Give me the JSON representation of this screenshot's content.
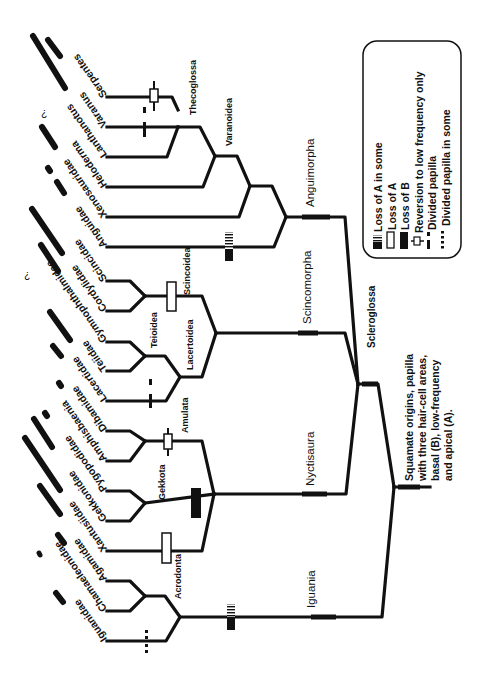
{
  "figure": {
    "orientation": "rotated 90 degrees clockwise (tips on the left, root on the right)",
    "taxa": [
      {
        "name": "Serpentes",
        "papilla_bar": "long"
      },
      {
        "name": "Varanus",
        "papilla_bar": "long"
      },
      {
        "name": "Lanthanotus",
        "papilla_bar": "?"
      },
      {
        "name": "Heloderma",
        "papilla_bar": "medium"
      },
      {
        "name": "Xenosauridae",
        "papilla_bar": "dot"
      },
      {
        "name": "Anguidae",
        "papilla_bar": "short"
      },
      {
        "name": "Scincidae",
        "papilla_bar": "long"
      },
      {
        "name": "Cordylidae",
        "papilla_bar": "medium"
      },
      {
        "name": "Gymnophthalmidae",
        "papilla_bar": "?"
      },
      {
        "name": "Teiidae",
        "papilla_bar": "medium"
      },
      {
        "name": "Lacertidae",
        "papilla_bar": "short"
      },
      {
        "name": "Dibamidae",
        "papilla_bar": "dot"
      },
      {
        "name": "Amphisbaenia",
        "papilla_bar": "dot"
      },
      {
        "name": "Pygopodidae",
        "papilla_bar": "medium"
      },
      {
        "name": "Gekkonidae",
        "papilla_bar": "long"
      },
      {
        "name": "Xantusiidae",
        "papilla_bar": "medium"
      },
      {
        "name": "Agamidae",
        "papilla_bar": "short"
      },
      {
        "name": "Chamaeleonidae",
        "papilla_bar": "dot"
      },
      {
        "name": "Iguanidae",
        "papilla_bar": "short"
      }
    ],
    "question_mark": "?",
    "small_clades": {
      "thecoglossa": "Thecoglossa",
      "varanoidea": "Varanoidea",
      "scincoidea": "Scincoidea",
      "teioidea": "Teioidea",
      "lacertoidea": "Lacertoidea",
      "amulata": "Amulata",
      "gekkota": "Gekkota",
      "acrodonta": "Acrodonta"
    },
    "major_clades": {
      "anguimorpha": "Anguimorpha",
      "scincomorpha": "Scincomorpha",
      "nyctisaura": "Nyctisaura",
      "iguania": "Iguania",
      "scleroglossa": "Scleroglossa"
    },
    "root_note": {
      "line1": "Squamate origins, papilla",
      "line2": "with three hair-cell areas,",
      "line3": "basal (B), low-frequency",
      "line4": "and apical (A)."
    },
    "legend": {
      "items": [
        {
          "symbol": "hatched-bar",
          "label": "Loss of A in some"
        },
        {
          "symbol": "open-bar",
          "label": "Loss of A"
        },
        {
          "symbol": "solid-bar",
          "label": "Loss of B"
        },
        {
          "symbol": "crossed-open-bar",
          "label": "Reversion to low frequency only"
        },
        {
          "symbol": "split-dash",
          "label": "Divided papilla"
        },
        {
          "symbol": "dotted-dash",
          "label": "Divided papilla in some"
        }
      ]
    },
    "colors": {
      "line": "#111111",
      "background": "#ffffff"
    }
  }
}
